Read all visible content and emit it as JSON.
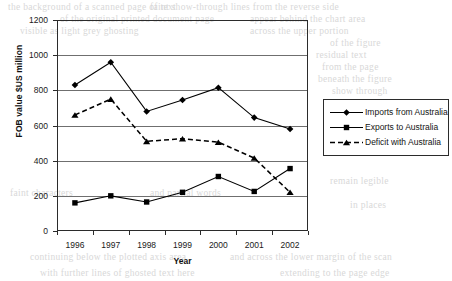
{
  "chart_data": {
    "type": "line",
    "title": "",
    "xlabel": "Year",
    "ylabel": "FOB value $US million",
    "categories": [
      "1996",
      "1997",
      "1998",
      "1999",
      "2000",
      "2001",
      "2002"
    ],
    "ylim": [
      0,
      1200
    ],
    "ytick_step": 200,
    "yticks": [
      "0",
      "200",
      "400",
      "600",
      "800",
      "1000",
      "1200"
    ],
    "grid": "horizontal",
    "legend_position": "right",
    "series": [
      {
        "name": "Imports from Australia",
        "marker": "diamond",
        "line_style": "solid",
        "color": "#000000",
        "values": [
          830,
          960,
          680,
          745,
          815,
          645,
          580
        ]
      },
      {
        "name": "Exports to Australia",
        "marker": "square",
        "line_style": "solid",
        "color": "#000000",
        "values": [
          160,
          200,
          165,
          220,
          310,
          225,
          355
        ]
      },
      {
        "name": "Deficit with Australia",
        "marker": "triangle",
        "line_style": "dashed",
        "color": "#000000",
        "values": [
          660,
          750,
          510,
          525,
          505,
          415,
          220
        ]
      }
    ]
  },
  "legend": {
    "items": [
      {
        "label": "Imports from Australia"
      },
      {
        "label": "Exports to Australia"
      },
      {
        "label": "Deficit with Australia"
      }
    ]
  },
  "background_text": [
    {
      "text": "the background of a scanned page of text",
      "x": 8,
      "y": 2
    },
    {
      "text": "faint show-through lines from the reverse side",
      "x": 150,
      "y": 2
    },
    {
      "text": "of the original printed document page",
      "x": 60,
      "y": 14
    },
    {
      "text": "appear behind the chart area",
      "x": 250,
      "y": 14
    },
    {
      "text": "visible as light grey ghosting",
      "x": 20,
      "y": 26
    },
    {
      "text": "across the upper portion",
      "x": 250,
      "y": 26
    },
    {
      "text": "of the figure",
      "x": 330,
      "y": 38
    },
    {
      "text": "residual text",
      "x": 316,
      "y": 50
    },
    {
      "text": "from the page",
      "x": 322,
      "y": 62
    },
    {
      "text": "beneath the figure",
      "x": 318,
      "y": 74
    },
    {
      "text": "show through",
      "x": 332,
      "y": 86
    },
    {
      "text": "faint characters",
      "x": 10,
      "y": 188
    },
    {
      "text": "and partial words",
      "x": 150,
      "y": 188
    },
    {
      "text": "remain legible",
      "x": 330,
      "y": 176
    },
    {
      "text": "in places",
      "x": 350,
      "y": 200
    },
    {
      "text": "continuing below the plotted axis area",
      "x": 30,
      "y": 252
    },
    {
      "text": "and across the lower margin of the scan",
      "x": 230,
      "y": 252
    },
    {
      "text": "with further lines of ghosted text here",
      "x": 40,
      "y": 268
    },
    {
      "text": "extending to the page edge",
      "x": 280,
      "y": 268
    }
  ]
}
